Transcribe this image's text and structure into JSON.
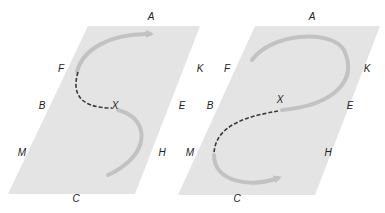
{
  "colors": {
    "plane": "#e4e4e4",
    "curve": "#c2c2c2",
    "dashed": "#3a3a3a",
    "label": "#222222"
  },
  "panels": [
    {
      "id": "left",
      "labels": {
        "A": {
          "text": "A",
          "x": 151,
          "y": 17
        },
        "F": {
          "text": "F",
          "x": 61,
          "y": 69
        },
        "K": {
          "text": "K",
          "x": 200,
          "y": 69
        },
        "B": {
          "text": "B",
          "x": 42,
          "y": 106
        },
        "X": {
          "text": "X",
          "x": 115,
          "y": 106
        },
        "E": {
          "text": "E",
          "x": 182,
          "y": 106
        },
        "M": {
          "text": "M",
          "x": 22,
          "y": 153
        },
        "H": {
          "text": "H",
          "x": 162,
          "y": 153
        },
        "C": {
          "text": "C",
          "x": 76,
          "y": 199
        }
      },
      "path": "Arrow from lower-right (near H) curving up through X, dashed section from X back to F, then solid arc up to arrowhead near A"
    },
    {
      "id": "right",
      "labels": {
        "A": {
          "text": "A",
          "x": 312,
          "y": 17
        },
        "F": {
          "text": "F",
          "x": 227,
          "y": 69
        },
        "K": {
          "text": "K",
          "x": 367,
          "y": 69
        },
        "B": {
          "text": "B",
          "x": 210,
          "y": 106
        },
        "X": {
          "text": "X",
          "x": 280,
          "y": 100
        },
        "E": {
          "text": "E",
          "x": 350,
          "y": 106
        },
        "M": {
          "text": "M",
          "x": 190,
          "y": 153
        },
        "H": {
          "text": "H",
          "x": 328,
          "y": 153
        },
        "C": {
          "text": "C",
          "x": 237,
          "y": 199
        }
      },
      "path": "Solid loop from near F up around A and K down to X, dashed section from X down-left toward M, then solid arc along bottom to arrowhead near C"
    }
  ]
}
